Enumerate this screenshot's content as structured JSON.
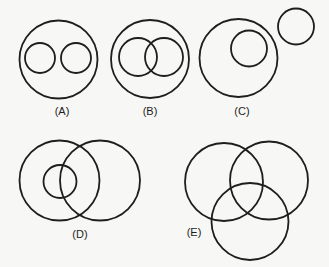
{
  "diagram": {
    "type": "venn-relationship-diagrams",
    "stroke_color": "#1e1e1e",
    "background": "#f7f7f5",
    "panels": [
      {
        "id": "A",
        "label": "(A)",
        "label_pos": [
          62,
          112
        ],
        "description": "Two disjoint circles inside a larger circle",
        "circles": [
          {
            "role": "outer",
            "cx": 58.5,
            "cy": 59.5,
            "r": 39
          },
          {
            "role": "inner-left",
            "cx": 40,
            "cy": 58,
            "r": 15
          },
          {
            "role": "inner-right",
            "cx": 76,
            "cy": 58,
            "r": 15
          }
        ]
      },
      {
        "id": "B",
        "label": "(B)",
        "label_pos": [
          150,
          112
        ],
        "description": "Two overlapping circles inside a larger circle",
        "circles": [
          {
            "role": "outer",
            "cx": 150,
            "cy": 59,
            "r": 39
          },
          {
            "role": "inner-left",
            "cx": 138,
            "cy": 57,
            "r": 19
          },
          {
            "role": "inner-right",
            "cx": 164,
            "cy": 57,
            "r": 19
          }
        ]
      },
      {
        "id": "C",
        "label": "(C)",
        "label_pos": [
          242,
          112
        ],
        "description": "A circle inside a larger circle, with a separate disjoint circle",
        "circles": [
          {
            "role": "outer",
            "cx": 238.5,
            "cy": 58,
            "r": 39
          },
          {
            "role": "inner",
            "cx": 249,
            "cy": 48.5,
            "r": 18
          },
          {
            "role": "separate",
            "cx": 296,
            "cy": 26.5,
            "r": 18
          }
        ]
      },
      {
        "id": "D",
        "label": "(D)",
        "label_pos": [
          80,
          235
        ],
        "description": "Two overlapping circles; a small circle inside the left one, overlapping the right",
        "circles": [
          {
            "role": "left",
            "cx": 59.5,
            "cy": 180.5,
            "r": 40
          },
          {
            "role": "right",
            "cx": 100,
            "cy": 180.5,
            "r": 40
          },
          {
            "role": "small",
            "cx": 60,
            "cy": 181.5,
            "r": 16.5
          }
        ]
      },
      {
        "id": "E",
        "label": "(E)",
        "label_pos": [
          194,
          233
        ],
        "description": "Three mutually overlapping circles",
        "circles": [
          {
            "role": "top-left",
            "cx": 224,
            "cy": 182,
            "r": 39
          },
          {
            "role": "top-right",
            "cx": 269,
            "cy": 180.5,
            "r": 39
          },
          {
            "role": "bottom",
            "cx": 250,
            "cy": 221.5,
            "r": 38.5
          }
        ]
      }
    ]
  }
}
